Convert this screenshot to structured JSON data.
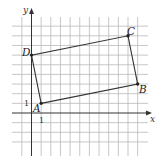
{
  "diagram": {
    "type": "coordinate-grid-quadrilateral",
    "axes": {
      "x_label": "x",
      "y_label": "y",
      "unit_tick_x": "1",
      "unit_tick_y": "1"
    },
    "grid": {
      "x_range": [
        -1,
        11
      ],
      "y_range": [
        -3,
        9
      ]
    },
    "vertices": [
      {
        "name": "A",
        "x": 1,
        "y": 1
      },
      {
        "name": "B",
        "x": 11,
        "y": 3
      },
      {
        "name": "C",
        "x": 10,
        "y": 8
      },
      {
        "name": "D",
        "x": 0,
        "y": 6
      }
    ],
    "edges": [
      [
        "A",
        "B"
      ],
      [
        "B",
        "C"
      ],
      [
        "C",
        "D"
      ],
      [
        "D",
        "A"
      ]
    ],
    "colors": {
      "grid": "#b9b9b9",
      "axes": "#333333",
      "shape": "#333333"
    }
  }
}
